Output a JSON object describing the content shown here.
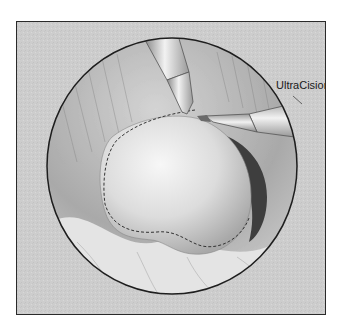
{
  "illustration": {
    "label": "UltraCision",
    "colors": {
      "background": "#cfcfcf",
      "frame_border": "#2a2a2a",
      "circle_border": "#1e1e1e",
      "tissue_light": "#e9e9e9",
      "tissue_mid": "#b9b9b9",
      "tissue_dark": "#5a5a5a",
      "instrument": "#d8d8d8"
    }
  }
}
